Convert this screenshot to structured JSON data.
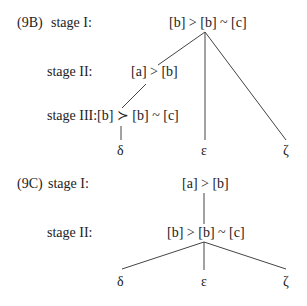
{
  "diagram_9B": {
    "label": "(9B)",
    "stage1": {
      "label": "stage I:",
      "node": "[b] > [b] ~ [c]"
    },
    "stage2": {
      "label": "stage II:",
      "node": "[a] > [b]"
    },
    "stage3": {
      "label": "stage III:",
      "node": "[b] ≻ [b] ~ [c]"
    },
    "leaves": [
      "δ",
      "ε",
      "ζ"
    ]
  },
  "diagram_9C": {
    "label": "(9C)",
    "stage1": {
      "label": "stage I:",
      "node": "[a] > [b]"
    },
    "stage2": {
      "label": "stage II:",
      "node": "[b] > [b] ~ [c]"
    },
    "leaves": [
      "δ",
      "ε",
      "ζ"
    ]
  }
}
